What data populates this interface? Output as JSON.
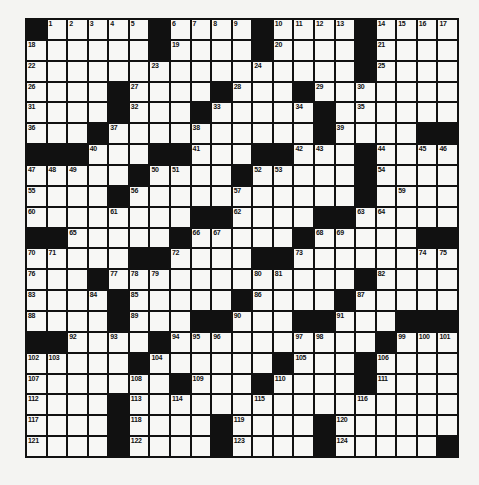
{
  "puzzle": {
    "type": "crossword",
    "rows": 21,
    "cols": 21,
    "layout": [
      "#.....#....#....#....",
      "......#....#....#....",
      "................#....",
      "....#....#...#.......",
      "....#...#.....#......",
      "...#..........#....##",
      "###...##...##...#....",
      ".....#....#.....#....",
      "....#...........#....",
      "........##....##.....",
      "##.....#.....#.....##",
      ".....##....##........",
      "...#............#....",
      "....#.....#....#.....",
      "....#...##...##...###",
      "##....#..........#...",
      ".....#......#...#....",
      ".......#...#....#....",
      "....#................",
      "....#....#....#......",
      "....#....#....#.....#"
    ],
    "numbers": [
      [
        0,
        1,
        1
      ],
      [
        0,
        2,
        2
      ],
      [
        0,
        3,
        3
      ],
      [
        0,
        4,
        4
      ],
      [
        0,
        5,
        5
      ],
      [
        0,
        7,
        6
      ],
      [
        0,
        8,
        7
      ],
      [
        0,
        9,
        8
      ],
      [
        0,
        10,
        9
      ],
      [
        0,
        12,
        10
      ],
      [
        0,
        13,
        11
      ],
      [
        0,
        14,
        12
      ],
      [
        0,
        15,
        13
      ],
      [
        0,
        17,
        14
      ],
      [
        0,
        18,
        15
      ],
      [
        0,
        19,
        16
      ],
      [
        0,
        20,
        17
      ],
      [
        1,
        0,
        18
      ],
      [
        1,
        7,
        19
      ],
      [
        1,
        12,
        20
      ],
      [
        1,
        17,
        21
      ],
      [
        2,
        0,
        22
      ],
      [
        2,
        6,
        23
      ],
      [
        2,
        11,
        24
      ],
      [
        2,
        17,
        25
      ],
      [
        3,
        0,
        26
      ],
      [
        3,
        5,
        27
      ],
      [
        3,
        10,
        28
      ],
      [
        3,
        14,
        29
      ],
      [
        3,
        16,
        30
      ],
      [
        4,
        0,
        31
      ],
      [
        4,
        5,
        32
      ],
      [
        4,
        9,
        33
      ],
      [
        4,
        13,
        34
      ],
      [
        4,
        16,
        35
      ],
      [
        5,
        0,
        36
      ],
      [
        5,
        4,
        37
      ],
      [
        5,
        8,
        38
      ],
      [
        5,
        15,
        39
      ],
      [
        6,
        3,
        40
      ],
      [
        6,
        8,
        41
      ],
      [
        6,
        13,
        42
      ],
      [
        6,
        14,
        43
      ],
      [
        6,
        17,
        44
      ],
      [
        6,
        19,
        45
      ],
      [
        6,
        20,
        46
      ],
      [
        7,
        0,
        47
      ],
      [
        7,
        1,
        48
      ],
      [
        7,
        2,
        49
      ],
      [
        7,
        6,
        50
      ],
      [
        7,
        7,
        51
      ],
      [
        7,
        11,
        52
      ],
      [
        7,
        12,
        53
      ],
      [
        7,
        17,
        54
      ],
      [
        8,
        0,
        55
      ],
      [
        8,
        5,
        56
      ],
      [
        8,
        10,
        57
      ],
      [
        8,
        16,
        58
      ],
      [
        8,
        18,
        59
      ],
      [
        9,
        0,
        60
      ],
      [
        9,
        4,
        61
      ],
      [
        9,
        10,
        62
      ],
      [
        9,
        16,
        63
      ],
      [
        9,
        17,
        64
      ],
      [
        10,
        2,
        65
      ],
      [
        10,
        8,
        66
      ],
      [
        10,
        9,
        67
      ],
      [
        10,
        14,
        68
      ],
      [
        10,
        15,
        69
      ],
      [
        11,
        0,
        70
      ],
      [
        11,
        1,
        71
      ],
      [
        11,
        7,
        72
      ],
      [
        11,
        13,
        73
      ],
      [
        11,
        19,
        74
      ],
      [
        11,
        20,
        75
      ],
      [
        12,
        0,
        76
      ],
      [
        12,
        4,
        77
      ],
      [
        12,
        5,
        78
      ],
      [
        12,
        6,
        79
      ],
      [
        12,
        11,
        80
      ],
      [
        12,
        12,
        81
      ],
      [
        12,
        17,
        82
      ],
      [
        13,
        0,
        83
      ],
      [
        13,
        3,
        84
      ],
      [
        13,
        5,
        85
      ],
      [
        13,
        11,
        86
      ],
      [
        13,
        16,
        87
      ],
      [
        14,
        0,
        88
      ],
      [
        14,
        5,
        89
      ],
      [
        14,
        10,
        90
      ],
      [
        14,
        15,
        91
      ],
      [
        15,
        2,
        92
      ],
      [
        15,
        4,
        93
      ],
      [
        15,
        7,
        94
      ],
      [
        15,
        8,
        95
      ],
      [
        15,
        9,
        96
      ],
      [
        15,
        13,
        97
      ],
      [
        15,
        14,
        98
      ],
      [
        15,
        18,
        99
      ],
      [
        15,
        19,
        100
      ],
      [
        15,
        20,
        101
      ],
      [
        16,
        0,
        102
      ],
      [
        16,
        1,
        103
      ],
      [
        16,
        6,
        104
      ],
      [
        16,
        13,
        105
      ],
      [
        16,
        17,
        106
      ],
      [
        17,
        0,
        107
      ],
      [
        17,
        5,
        108
      ],
      [
        17,
        8,
        109
      ],
      [
        17,
        12,
        110
      ],
      [
        17,
        17,
        111
      ],
      [
        18,
        0,
        112
      ],
      [
        18,
        5,
        113
      ],
      [
        18,
        7,
        114
      ],
      [
        18,
        11,
        115
      ],
      [
        18,
        16,
        116
      ],
      [
        19,
        0,
        117
      ],
      [
        19,
        5,
        118
      ],
      [
        19,
        10,
        119
      ],
      [
        19,
        15,
        120
      ],
      [
        20,
        0,
        121
      ],
      [
        20,
        5,
        122
      ],
      [
        20,
        10,
        123
      ],
      [
        20,
        15,
        124
      ]
    ],
    "colors": {
      "black": "#111111",
      "white": "#f7f7f5",
      "paper": "#f4f4f2"
    }
  }
}
